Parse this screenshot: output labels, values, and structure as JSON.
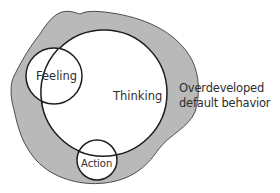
{
  "diagram": {
    "labels": {
      "feeling": "Feeling",
      "thinking": "Thinking",
      "action": "Action",
      "region_line1": "Overdeveloped",
      "region_line2": "default behavior"
    },
    "colors": {
      "region_fill": "#b9b9b9",
      "circle_fill": "#ffffff",
      "stroke": "#1e1e1e",
      "text": "#2e2e2e",
      "background": "#ffffff"
    },
    "shapes": {
      "thinking_circle": {
        "cx": 104,
        "cy": 93,
        "r": 63
      },
      "feeling_circle": {
        "cx": 54,
        "cy": 76,
        "r": 28
      },
      "action_circle": {
        "cx": 97,
        "cy": 160,
        "r": 20
      }
    }
  }
}
